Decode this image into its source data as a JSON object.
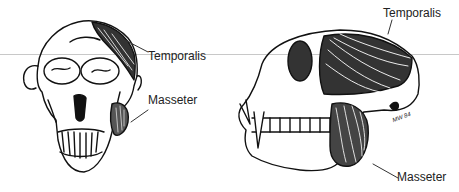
{
  "figure": {
    "front_view": {
      "labels": {
        "temporalis": "Temporalis",
        "masseter": "Masseter"
      }
    },
    "side_view": {
      "labels": {
        "temporalis": "Temporalis",
        "masseter": "Masseter"
      },
      "signature": "MW 84"
    }
  },
  "colors": {
    "ink": "#111111",
    "rule": "#c8c8c8",
    "background": "#ffffff"
  }
}
